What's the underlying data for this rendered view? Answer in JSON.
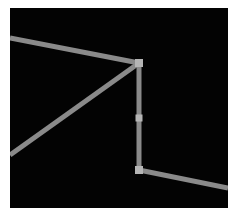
{
  "diagram": {
    "background": "#030303",
    "page_background": "#ffffff",
    "stroke_color": "#8a8a8a",
    "joint_color": "#b5b5b5",
    "stroke_width": 5,
    "segments": [
      {
        "id": "top-left-beam",
        "x1": 0,
        "y1": 30,
        "x2": 129,
        "y2": 55
      },
      {
        "id": "diagonal-brace",
        "x1": 0,
        "y1": 147,
        "x2": 129,
        "y2": 55
      },
      {
        "id": "vertical-post",
        "x1": 129,
        "y1": 55,
        "x2": 129,
        "y2": 162
      },
      {
        "id": "bottom-right-beam",
        "x1": 129,
        "y1": 162,
        "x2": 218,
        "y2": 180
      }
    ],
    "joints": [
      {
        "id": "top-joint",
        "x": 129,
        "y": 55,
        "size": 8
      },
      {
        "id": "mid-joint",
        "x": 129,
        "y": 110,
        "size": 7
      },
      {
        "id": "bottom-joint",
        "x": 129,
        "y": 162,
        "size": 8
      }
    ]
  }
}
